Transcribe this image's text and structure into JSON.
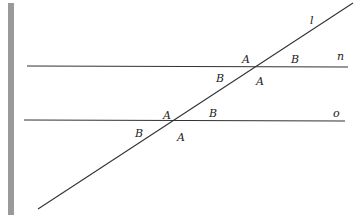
{
  "diagram": {
    "type": "parallel-lines-transversal",
    "lines": {
      "n": {
        "label": "n",
        "x1": 27,
        "y1": 66,
        "x2": 348,
        "y2": 67
      },
      "o": {
        "label": "o",
        "x1": 24,
        "y1": 120,
        "x2": 345,
        "y2": 121
      },
      "l": {
        "label": "l",
        "x1": 38,
        "y1": 209,
        "x2": 353,
        "y2": 3
      }
    },
    "line_labels": [
      {
        "text": "l",
        "x": 310,
        "y": 24
      },
      {
        "text": "n",
        "x": 337,
        "y": 60
      },
      {
        "text": "o",
        "x": 333,
        "y": 117
      }
    ],
    "angle_labels": [
      {
        "text": "A",
        "x": 242,
        "y": 63
      },
      {
        "text": "B",
        "x": 291,
        "y": 63
      },
      {
        "text": "B",
        "x": 216,
        "y": 82
      },
      {
        "text": "A",
        "x": 256,
        "y": 85
      },
      {
        "text": "A",
        "x": 163,
        "y": 119
      },
      {
        "text": "B",
        "x": 209,
        "y": 117
      },
      {
        "text": "B",
        "x": 135,
        "y": 137
      },
      {
        "text": "A",
        "x": 177,
        "y": 141
      }
    ],
    "colors": {
      "line": "#333333",
      "bar": "#9a9a9a",
      "label": "#222222"
    }
  }
}
